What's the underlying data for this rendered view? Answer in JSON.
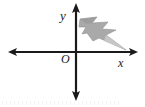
{
  "figure": {
    "type": "coordinate-plane-diagram",
    "background_color": "#ffffff",
    "axis_color": "#1a1a1a",
    "labels": {
      "y_axis": "y",
      "x_axis": "x",
      "origin": "O"
    },
    "axes": {
      "x_axis": {
        "y_position": 52,
        "start_x": 10,
        "end_x": 136,
        "arrows": "both",
        "stroke_width": 2.2
      },
      "y_axis": {
        "x_position": 76,
        "start_y": 4,
        "end_y": 100,
        "arrows": "both",
        "stroke_width": 2.2
      }
    },
    "shape": {
      "name": "lightning-bolt",
      "quadrant": 1,
      "fill_color": "#a9a9a9",
      "edge_color": "#8d8d8d",
      "highlight_color": "#c9c9c9",
      "description": "gray lightning bolt / arrow shape tapering to a point toward the lower right",
      "tip_point": [
        126,
        50
      ],
      "tail_point": [
        80,
        19
      ]
    }
  }
}
